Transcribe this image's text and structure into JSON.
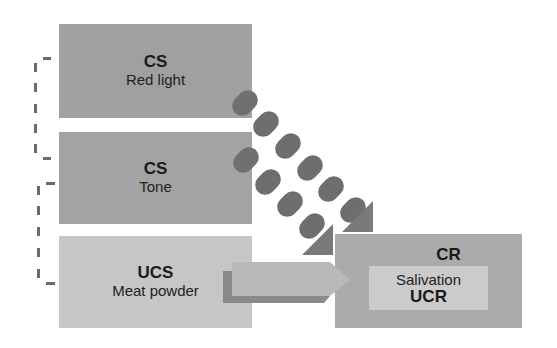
{
  "diagram": {
    "type": "classical-conditioning",
    "nodes": [
      {
        "id": "cs1",
        "title": "CS",
        "label": "Red light",
        "color": "#a0a0a0"
      },
      {
        "id": "cs2",
        "title": "CS",
        "label": "Tone",
        "color": "#a3a3a3"
      },
      {
        "id": "ucs",
        "title": "UCS",
        "label": "Meat powder",
        "color": "#c6c6c6"
      },
      {
        "id": "cr",
        "title": "CR",
        "label": "Salivation",
        "inner_title": "UCR",
        "color": "#ababab",
        "inner_color": "#cbcbcb"
      }
    ],
    "edges": [
      {
        "from": "cs1",
        "to": "cr",
        "style": "beads"
      },
      {
        "from": "cs2",
        "to": "cr",
        "style": "beads"
      },
      {
        "from": "ucs",
        "to": "cr",
        "style": "arrow"
      }
    ],
    "bracket": {
      "style": "dashed",
      "spans": [
        "cs1",
        "cs2",
        "ucs"
      ]
    },
    "colors": {
      "bead": "#6e6e6e",
      "bead_shadow": "#5c5c5c",
      "arrow_head": "#7a7a7a",
      "arrow_body": "#b9b9b9",
      "arrow_shadow": "#8a8a8a",
      "bracket": "#6a6a6a"
    }
  }
}
